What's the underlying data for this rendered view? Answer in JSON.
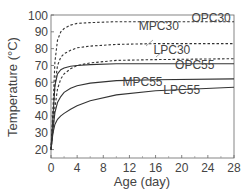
{
  "chart_data": {
    "type": "line",
    "title": "",
    "xlabel": "Age (day)",
    "ylabel": "Temperature (°C)",
    "xlim": [
      0,
      28
    ],
    "ylim": [
      15,
      100
    ],
    "xticks": [
      0,
      4,
      8,
      12,
      16,
      20,
      24,
      28
    ],
    "yticks": [
      20,
      30,
      40,
      50,
      60,
      70,
      80,
      90,
      100
    ],
    "grid": false,
    "legend": "inline labels",
    "series": [
      {
        "name": "OPC30",
        "style": "dashed",
        "x": [
          0,
          0.3,
          0.6,
          1,
          1.5,
          2,
          3,
          4,
          6,
          10,
          16,
          28
        ],
        "values": [
          20,
          45,
          72,
          85,
          90,
          92,
          94,
          95,
          95.5,
          96,
          96,
          96
        ]
      },
      {
        "name": "MPC30",
        "style": "dashed",
        "x": [
          0,
          0.3,
          0.6,
          1,
          1.5,
          2,
          3,
          4,
          6,
          10,
          16,
          28
        ],
        "values": [
          20,
          38,
          58,
          70,
          75,
          77,
          79,
          80.5,
          81.5,
          82.5,
          83,
          83
        ]
      },
      {
        "name": "LPC30",
        "style": "dashed",
        "x": [
          0,
          0.3,
          0.6,
          1,
          1.5,
          2,
          3,
          4,
          6,
          10,
          16,
          28
        ],
        "values": [
          20,
          32,
          45,
          56,
          62,
          65,
          68,
          70,
          71.5,
          73,
          73.5,
          74
        ]
      },
      {
        "name": "OPC55",
        "style": "solid",
        "x": [
          0,
          0.3,
          0.6,
          1,
          1.5,
          2,
          3,
          4,
          6,
          10,
          16,
          28
        ],
        "values": [
          20,
          40,
          58,
          65,
          67.5,
          68.5,
          69.5,
          70,
          70.5,
          71,
          71,
          71
        ]
      },
      {
        "name": "MPC55",
        "style": "solid",
        "x": [
          0,
          0.3,
          0.6,
          1,
          1.5,
          2,
          3,
          4,
          6,
          10,
          16,
          28
        ],
        "values": [
          20,
          32,
          42,
          48,
          51.5,
          54,
          56.5,
          58,
          59.5,
          61,
          61.5,
          62
        ]
      },
      {
        "name": "LPC55",
        "style": "solid",
        "x": [
          0,
          0.3,
          0.6,
          1,
          1.5,
          2,
          3,
          4,
          6,
          10,
          16,
          28
        ],
        "values": [
          20,
          30,
          35,
          38,
          40,
          41.5,
          44,
          46,
          49,
          52.5,
          55,
          57
        ]
      }
    ],
    "labels": [
      {
        "text": "OPC30",
        "x": 24.5,
        "y": 96
      },
      {
        "text": "MPC30",
        "x": 16.5,
        "y": 91
      },
      {
        "text": "LPC30",
        "x": 18.5,
        "y": 77
      },
      {
        "text": "OPC55",
        "x": 22,
        "y": 68
      },
      {
        "text": "MPC55",
        "x": 14,
        "y": 58
      },
      {
        "text": "LPC55",
        "x": 20,
        "y": 53
      }
    ]
  }
}
